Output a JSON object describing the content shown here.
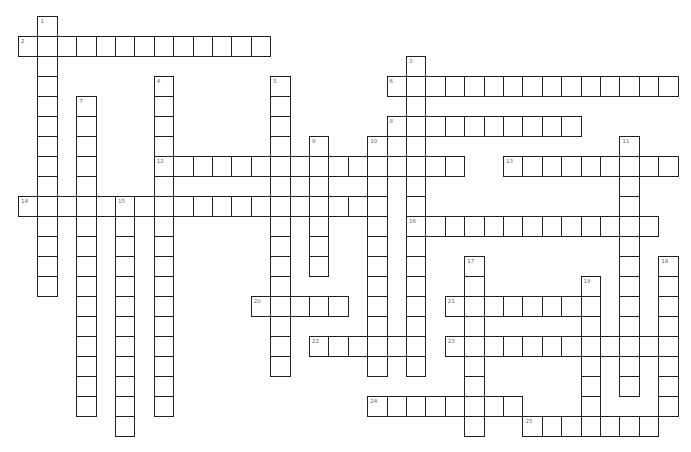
{
  "puzzle": {
    "type": "crossword",
    "grid": {
      "origin_x": 18,
      "origin_y": 16,
      "pitch_x": 19.4,
      "pitch_y": 20
    },
    "colors": {
      "border": "#222222",
      "cell": "#ffffff",
      "number": "#666666"
    },
    "words": [
      {
        "number": "1",
        "direction": "down",
        "col": 1,
        "row": 0,
        "length": 14
      },
      {
        "number": "2",
        "direction": "across",
        "col": 0,
        "row": 1,
        "length": 13
      },
      {
        "number": "3",
        "direction": "down",
        "col": 20,
        "row": 2,
        "length": 16
      },
      {
        "number": "4",
        "direction": "down",
        "col": 7,
        "row": 3,
        "length": 17
      },
      {
        "number": "5",
        "direction": "down",
        "col": 13,
        "row": 3,
        "length": 15
      },
      {
        "number": "6",
        "direction": "across",
        "col": 19,
        "row": 3,
        "length": 15
      },
      {
        "number": "7",
        "direction": "down",
        "col": 3,
        "row": 4,
        "length": 16
      },
      {
        "number": "8",
        "direction": "across",
        "col": 19,
        "row": 5,
        "length": 10
      },
      {
        "number": "9",
        "direction": "down",
        "col": 15,
        "row": 6,
        "length": 7
      },
      {
        "number": "10",
        "direction": "down",
        "col": 18,
        "row": 6,
        "length": 12
      },
      {
        "number": "11",
        "direction": "down",
        "col": 31,
        "row": 6,
        "length": 13
      },
      {
        "number": "12",
        "direction": "across",
        "col": 7,
        "row": 7,
        "length": 16
      },
      {
        "number": "13",
        "direction": "across",
        "col": 25,
        "row": 7,
        "length": 9
      },
      {
        "number": "14",
        "direction": "across",
        "col": 0,
        "row": 9,
        "length": 19
      },
      {
        "number": "15",
        "direction": "down",
        "col": 5,
        "row": 9,
        "length": 12
      },
      {
        "number": "16",
        "direction": "across",
        "col": 20,
        "row": 10,
        "length": 13
      },
      {
        "number": "17",
        "direction": "down",
        "col": 23,
        "row": 12,
        "length": 9
      },
      {
        "number": "18",
        "direction": "down",
        "col": 33,
        "row": 12,
        "length": 8
      },
      {
        "number": "19",
        "direction": "down",
        "col": 29,
        "row": 13,
        "length": 8
      },
      {
        "number": "20",
        "direction": "across",
        "col": 12,
        "row": 14,
        "length": 5
      },
      {
        "number": "21",
        "direction": "across",
        "col": 22,
        "row": 14,
        "length": 8
      },
      {
        "number": "22",
        "direction": "across",
        "col": 15,
        "row": 16,
        "length": 6
      },
      {
        "number": "23",
        "direction": "across",
        "col": 22,
        "row": 16,
        "length": 12
      },
      {
        "number": "24",
        "direction": "across",
        "col": 18,
        "row": 19,
        "length": 8
      },
      {
        "number": "25",
        "direction": "across",
        "col": 26,
        "row": 20,
        "length": 7
      }
    ]
  }
}
